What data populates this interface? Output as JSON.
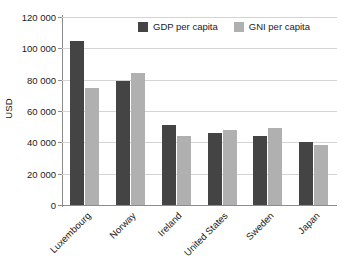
{
  "chart_data": {
    "type": "bar",
    "title": "",
    "xlabel": "",
    "ylabel": "USD",
    "ylim": [
      0,
      120000
    ],
    "ytick_step": 20000,
    "ytick_labels": [
      "120 000",
      "100 000",
      "80 000",
      "60 000",
      "40 000",
      "20 000",
      "0"
    ],
    "ytick_values": [
      120000,
      100000,
      80000,
      60000,
      40000,
      20000,
      0
    ],
    "grid": true,
    "legend_position": "top-center",
    "categories": [
      "Luxembourg",
      "Norway",
      "Ireland",
      "United States",
      "Sweden",
      "Japan"
    ],
    "series": [
      {
        "name": "GDP per capita",
        "color": "#444444",
        "values": [
          105000,
          79000,
          51000,
          46000,
          44000,
          40000
        ]
      },
      {
        "name": "GNI per capita",
        "color": "#b0b0b0",
        "values": [
          74500,
          84500,
          44000,
          48000,
          49000,
          38000
        ]
      }
    ]
  },
  "colors": {
    "series_gdp": "#444444",
    "series_gni": "#b0b0b0",
    "gridline": "#d4d4d4",
    "axis": "#8c8c8c",
    "text": "#1a1a1a",
    "background": "#ffffff"
  }
}
